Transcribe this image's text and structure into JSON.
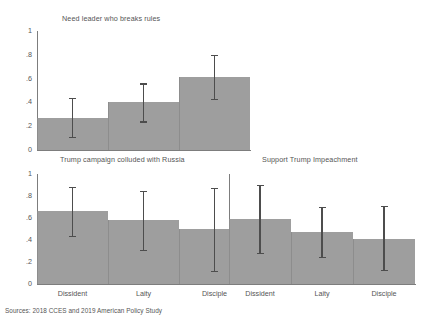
{
  "figure": {
    "source_note": "Sources: 2018 CCES and 2019 American Policy Study",
    "bar_color": "#9e9e9e",
    "error_color": "#4d4d4d",
    "axis_color": "#7d7d7d",
    "background": "#ffffff"
  },
  "chart_data": [
    {
      "type": "bar",
      "title": "Need leader who breaks rules",
      "panel": "top",
      "categories": [
        "Dissident",
        "Laity",
        "Disciple"
      ],
      "values": [
        0.27,
        0.4,
        0.61
      ],
      "error_low": [
        0.11,
        0.24,
        0.43
      ],
      "error_high": [
        0.44,
        0.56,
        0.8
      ],
      "xlabel": "",
      "ylabel": "",
      "ylim": [
        0,
        1
      ],
      "yticks": [
        0,
        0.2,
        0.4,
        0.6,
        0.8,
        1
      ],
      "ytick_labels": [
        "0",
        ".2",
        ".4",
        ".6",
        ".8",
        "1"
      ],
      "grid": false,
      "legend": "none"
    },
    {
      "type": "bar",
      "title": "Trump campaign colluded with Russia",
      "panel": "bottom-left",
      "categories": [
        "Dissident",
        "Laity",
        "Disciple"
      ],
      "values": [
        0.66,
        0.58,
        0.5
      ],
      "error_low": [
        0.44,
        0.31,
        0.12
      ],
      "error_high": [
        0.88,
        0.85,
        0.87
      ],
      "xlabel": "",
      "ylabel": "",
      "ylim": [
        0,
        1
      ],
      "yticks": [
        0,
        0.2,
        0.4,
        0.6,
        0.8,
        1
      ],
      "ytick_labels": [
        "0",
        ".2",
        ".4",
        ".6",
        ".8",
        "1"
      ],
      "grid": false,
      "legend": "none"
    },
    {
      "type": "bar",
      "title": "Support Trump Impeachment",
      "panel": "bottom-right",
      "categories": [
        "Dissident",
        "Laity",
        "Disciple"
      ],
      "values": [
        0.59,
        0.47,
        0.41
      ],
      "error_low": [
        0.28,
        0.25,
        0.13
      ],
      "error_high": [
        0.9,
        0.7,
        0.71
      ],
      "xlabel": "",
      "ylabel": "",
      "ylim": [
        0,
        1
      ],
      "yticks": [
        0,
        0.2,
        0.4,
        0.6,
        0.8,
        1
      ],
      "ytick_labels": [],
      "grid": false,
      "legend": "none"
    }
  ]
}
